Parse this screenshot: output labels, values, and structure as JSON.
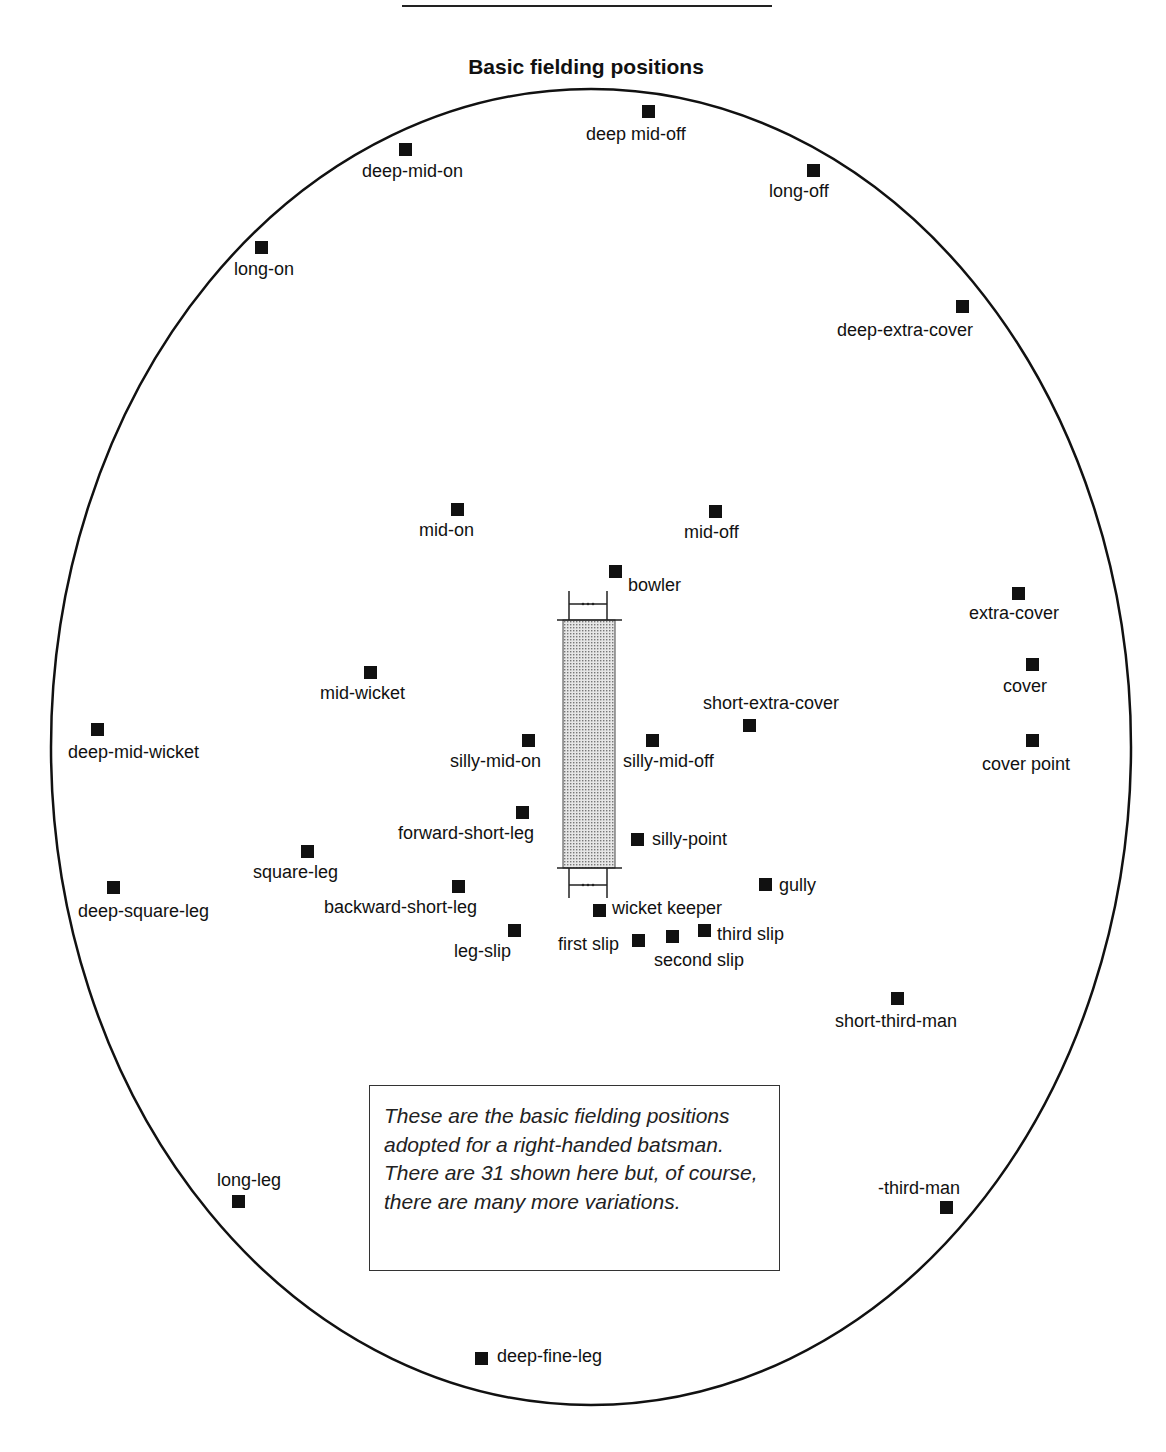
{
  "title": "Basic fielding positions",
  "note": "These are the basic fielding positions adopted for a right-handed batsman. There are 31 shown here but, of course, there are many more variations.",
  "field": {
    "cx": 591,
    "cy": 747,
    "rx": 540,
    "ry": 658
  },
  "positions": [
    {
      "id": "deep-mid-off",
      "label": "deep mid-off",
      "mx": 642,
      "my": 105,
      "lx": 586,
      "ly": 124
    },
    {
      "id": "deep-mid-on",
      "label": "deep-mid-on",
      "mx": 399,
      "my": 143,
      "lx": 362,
      "ly": 161
    },
    {
      "id": "long-off",
      "label": "long-off",
      "mx": 807,
      "my": 164,
      "lx": 769,
      "ly": 181
    },
    {
      "id": "long-on",
      "label": "long-on",
      "mx": 255,
      "my": 241,
      "lx": 234,
      "ly": 259
    },
    {
      "id": "deep-extra-cover",
      "label": "deep-extra-cover",
      "mx": 956,
      "my": 300,
      "lx": 837,
      "ly": 320
    },
    {
      "id": "mid-on",
      "label": "mid-on",
      "mx": 451,
      "my": 503,
      "lx": 419,
      "ly": 520
    },
    {
      "id": "mid-off",
      "label": "mid-off",
      "mx": 709,
      "my": 505,
      "lx": 684,
      "ly": 522
    },
    {
      "id": "bowler",
      "label": "bowler",
      "mx": 609,
      "my": 565,
      "lx": 628,
      "ly": 575
    },
    {
      "id": "extra-cover",
      "label": "extra-cover",
      "mx": 1012,
      "my": 587,
      "lx": 969,
      "ly": 603
    },
    {
      "id": "cover",
      "label": "cover",
      "mx": 1026,
      "my": 658,
      "lx": 1003,
      "ly": 676
    },
    {
      "id": "mid-wicket",
      "label": "mid-wicket",
      "mx": 364,
      "my": 666,
      "lx": 320,
      "ly": 683
    },
    {
      "id": "short-extra-cover",
      "label": "short-extra-cover",
      "mx": 743,
      "my": 719,
      "lx": 703,
      "ly": 693
    },
    {
      "id": "deep-mid-wicket",
      "label": "deep-mid-wicket",
      "mx": 91,
      "my": 723,
      "lx": 68,
      "ly": 742
    },
    {
      "id": "silly-mid-on",
      "label": "silly-mid-on",
      "mx": 522,
      "my": 734,
      "lx": 450,
      "ly": 751
    },
    {
      "id": "silly-mid-off",
      "label": "silly-mid-off",
      "mx": 646,
      "my": 734,
      "lx": 623,
      "ly": 751
    },
    {
      "id": "cover-point",
      "label": "cover point",
      "mx": 1026,
      "my": 734,
      "lx": 982,
      "ly": 754
    },
    {
      "id": "forward-short-leg",
      "label": "forward-short-leg",
      "mx": 516,
      "my": 806,
      "lx": 398,
      "ly": 823
    },
    {
      "id": "silly-point",
      "label": "silly-point",
      "mx": 631,
      "my": 833,
      "lx": 652,
      "ly": 829
    },
    {
      "id": "square-leg",
      "label": "square-leg",
      "mx": 301,
      "my": 845,
      "lx": 253,
      "ly": 862
    },
    {
      "id": "gully",
      "label": "gully",
      "mx": 759,
      "my": 878,
      "lx": 779,
      "ly": 875
    },
    {
      "id": "deep-square-leg",
      "label": "deep-square-leg",
      "mx": 107,
      "my": 881,
      "lx": 78,
      "ly": 901
    },
    {
      "id": "backward-short-leg",
      "label": "backward-short-leg",
      "mx": 452,
      "my": 880,
      "lx": 324,
      "ly": 897
    },
    {
      "id": "wicket-keeper",
      "label": "wicket keeper",
      "mx": 593,
      "my": 904,
      "lx": 612,
      "ly": 898
    },
    {
      "id": "leg-slip",
      "label": "leg-slip",
      "mx": 508,
      "my": 924,
      "lx": 454,
      "ly": 941
    },
    {
      "id": "first-slip",
      "label": "first slip",
      "mx": 632,
      "my": 934,
      "lx": 558,
      "ly": 934
    },
    {
      "id": "second-slip",
      "label": "second slip",
      "mx": 666,
      "my": 930,
      "lx": 654,
      "ly": 950
    },
    {
      "id": "third-slip",
      "label": "third slip",
      "mx": 698,
      "my": 924,
      "lx": 717,
      "ly": 924
    },
    {
      "id": "short-third-man",
      "label": "short-third-man",
      "mx": 891,
      "my": 992,
      "lx": 835,
      "ly": 1011
    },
    {
      "id": "long-leg",
      "label": "long-leg",
      "mx": 232,
      "my": 1195,
      "lx": 217,
      "ly": 1170
    },
    {
      "id": "third-man",
      "label": "-third-man",
      "mx": 940,
      "my": 1201,
      "lx": 878,
      "ly": 1178
    },
    {
      "id": "deep-fine-leg",
      "label": "deep-fine-leg",
      "mx": 475,
      "my": 1352,
      "lx": 497,
      "ly": 1346
    }
  ],
  "pitch": {
    "x": 563,
    "y": 620,
    "w": 52,
    "h": 248,
    "fill": "#bdbdbd"
  }
}
